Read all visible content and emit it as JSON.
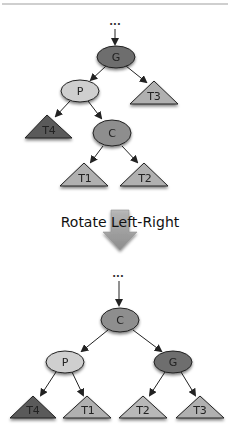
{
  "caption": "Rotate Left-Right",
  "ellipsis": "...",
  "colors": {
    "dark_node": "#6e6e6e",
    "mid_node": "#8e8e8e",
    "light_node": "#cfcfcf",
    "dark_tri": "#5a5a5a",
    "light_tri": "#b0b0b0",
    "arrow_fill": "#9a9a9a",
    "top_rule": "#999999"
  },
  "before": {
    "nodes": {
      "G": "G",
      "P": "P",
      "C": "C"
    },
    "subtrees": {
      "T1": "T1",
      "T2": "T2",
      "T3": "T3",
      "T4": "T4"
    }
  },
  "after": {
    "nodes": {
      "C": "C",
      "P": "P",
      "G": "G"
    },
    "subtrees": {
      "T4": "T4",
      "T1": "T1",
      "T2": "T2",
      "T3": "T3"
    }
  }
}
